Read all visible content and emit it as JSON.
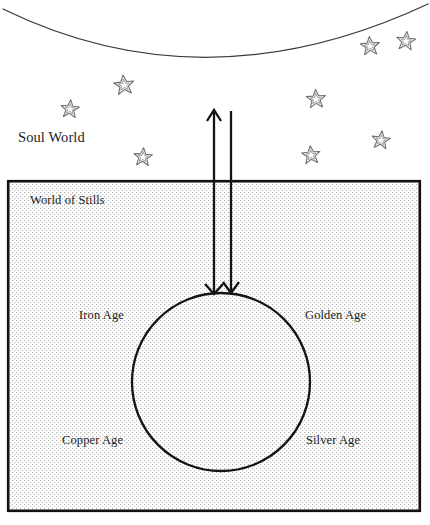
{
  "figure": {
    "type": "diagram",
    "title_visible": false,
    "width": 430,
    "height": 525,
    "background_color": "#ffffff",
    "ink_color": "#1c1c1c"
  },
  "labels": {
    "soul_world": "Soul World",
    "world_of_stills": "World of Stills",
    "iron_age": "Iron Age",
    "golden_age": "Golden Age",
    "copper_age": "Copper Age",
    "silver_age": "Silver Age"
  },
  "regions": {
    "upper": {
      "name": "Soul World",
      "fill": "#ffffff",
      "boundary_arc": {
        "shape": "downward-bowing arc spanning full width",
        "left_point": [
          3,
          9
        ],
        "apex": [
          205,
          72
        ],
        "right_point": [
          428,
          4
        ],
        "stroke_color": "#3a3a3a",
        "stroke_width": 1.2
      }
    },
    "lower": {
      "name": "World of Stills",
      "box": {
        "x": 7,
        "y": 180,
        "width": 414,
        "height": 332,
        "fill_pattern": "fine stipple dot grid",
        "fill_dot_color": "#b4b4b4",
        "border_color": "#111111",
        "border_width": 2.5
      }
    }
  },
  "cycle_circle": {
    "center": [
      221,
      382
    ],
    "radius": 89,
    "stroke_color": "#141414",
    "stroke_width": 2.2,
    "fill": "none",
    "quadrant_labels": {
      "upper_left": "Iron Age",
      "upper_right": "Golden Age",
      "lower_left": "Copper Age",
      "lower_right": "Silver Age"
    }
  },
  "arrows": [
    {
      "name": "ascending-arrow",
      "direction": "up",
      "x": 214,
      "from_y": 293,
      "to_y": 110,
      "head_at": "top",
      "second_head_at_y": 293,
      "stroke_color": "#141414",
      "stroke_width": 2.2
    },
    {
      "name": "descending-arrow",
      "direction": "down",
      "x": 231,
      "from_y": 110,
      "to_y": 293,
      "head_at": "bottom",
      "stroke_color": "#141414",
      "stroke_width": 2.2
    }
  ],
  "stars": {
    "count": 9,
    "style": "hand-drawn double-outline five-point star",
    "stroke_color": "#6b6b6b",
    "positions": [
      {
        "x": 370,
        "y": 46,
        "size": 19
      },
      {
        "x": 406,
        "y": 41,
        "size": 19
      },
      {
        "x": 124,
        "y": 85,
        "size": 20
      },
      {
        "x": 70,
        "y": 109,
        "size": 18
      },
      {
        "x": 316,
        "y": 99,
        "size": 19
      },
      {
        "x": 381,
        "y": 140,
        "size": 18
      },
      {
        "x": 311,
        "y": 155,
        "size": 18
      },
      {
        "x": 143,
        "y": 157,
        "size": 18
      },
      {
        "x": 146,
        "y": 157,
        "size": 0
      }
    ]
  }
}
